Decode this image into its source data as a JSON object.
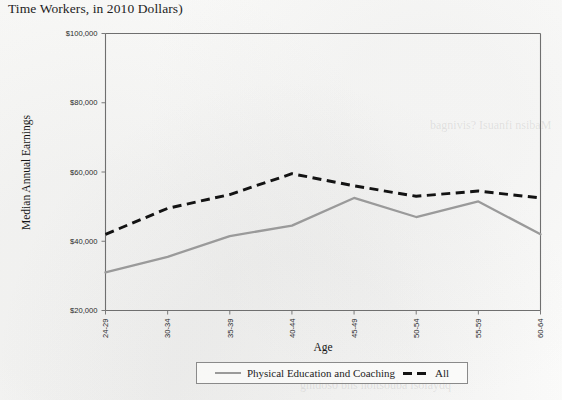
{
  "figure": {
    "title_fragment": "Time Workers, in 2010 Dollars)"
  },
  "legend": {
    "items": [
      {
        "label": "Physical Education and Coaching",
        "style": "solid",
        "color": "#9a9a9a"
      },
      {
        "label": "All",
        "style": "dashed",
        "color": "#131313"
      }
    ]
  },
  "chart_data": {
    "type": "line",
    "title": "Time Workers, in 2010 Dollars)",
    "xlabel": "Age",
    "ylabel": "Median Annual Earnings",
    "categories": [
      "24-29",
      "30-34",
      "35-39",
      "40-44",
      "45-49",
      "50-54",
      "55-59",
      "60-64"
    ],
    "ylim": [
      20000,
      100000
    ],
    "ytick_values": [
      20000,
      40000,
      60000,
      80000,
      100000
    ],
    "ytick_labels": [
      "$20,000",
      "$40,000",
      "$60,000",
      "$80,000",
      "$100,000"
    ],
    "grid": false,
    "legend_position": "bottom",
    "series": [
      {
        "name": "Physical Education and Coaching",
        "style": "solid",
        "color": "#9a9a9a",
        "values": [
          31000,
          35500,
          41500,
          44500,
          52500,
          47000,
          51500,
          42000
        ]
      },
      {
        "name": "All",
        "style": "dashed",
        "color": "#131313",
        "values": [
          42000,
          49500,
          53500,
          59500,
          56000,
          53000,
          54500,
          52500
        ]
      }
    ]
  },
  "ghost_text": {
    "right_mid": "bagnivis? Isuanfi nsibaM",
    "lower_right": "gnidos0 bns noitsouba isoiaydq"
  }
}
